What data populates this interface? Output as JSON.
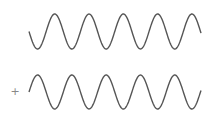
{
  "diagram": {
    "type": "wave-addition",
    "operator": "+",
    "colors": {
      "background": "#ffffff",
      "wave_stroke": "#555555",
      "operator": "#888888"
    },
    "waves": [
      {
        "name": "wave-top",
        "x_start": 29,
        "x_end": 201,
        "center_y": 31.5,
        "amplitude": 17.5,
        "period": 34.3,
        "phase": "inverted-sine",
        "cycles": 5
      },
      {
        "name": "wave-bottom",
        "x_start": 29,
        "x_end": 201,
        "center_y": 92,
        "amplitude": 17,
        "period": 34.3,
        "phase": "sine",
        "cycles": 5
      }
    ]
  }
}
